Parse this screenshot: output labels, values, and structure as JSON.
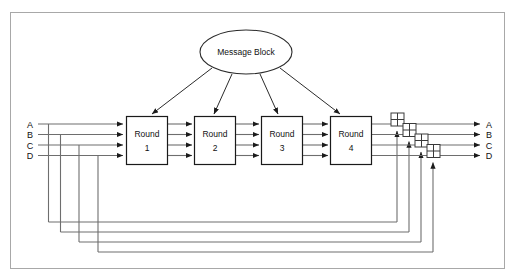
{
  "diagram": {
    "frame": {
      "stroke": "#9a9a9a",
      "fill": "#ffffff"
    },
    "colors": {
      "line": "#6e6e6e",
      "dark_line": "#4a4a4a",
      "box_stroke": "#1a1a1a",
      "box_fill": "#ffffff",
      "text": "#111111",
      "background": "#ffffff"
    },
    "message_block": {
      "label": "Message Block",
      "shape": "ellipse"
    },
    "rounds": [
      {
        "line1": "Round",
        "line2": "1"
      },
      {
        "line1": "Round",
        "line2": "2"
      },
      {
        "line1": "Round",
        "line2": "3"
      },
      {
        "line1": "Round",
        "line2": "4"
      }
    ],
    "inputs": [
      {
        "label": "A"
      },
      {
        "label": "B"
      },
      {
        "label": "C"
      },
      {
        "label": "D"
      }
    ],
    "outputs": [
      {
        "label": "A"
      },
      {
        "label": "B"
      },
      {
        "label": "C"
      },
      {
        "label": "D"
      }
    ],
    "adders": [
      {
        "name": "xor-adder-a",
        "symbol": "+"
      },
      {
        "name": "xor-adder-b",
        "symbol": "+"
      },
      {
        "name": "xor-adder-c",
        "symbol": "+"
      },
      {
        "name": "xor-adder-d",
        "symbol": "+"
      }
    ],
    "message_arrow_count": 4,
    "feedback_path_count": 4
  }
}
